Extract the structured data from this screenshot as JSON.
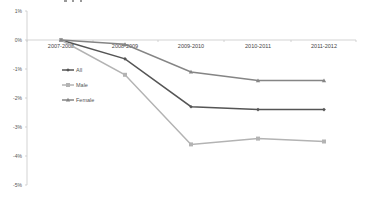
{
  "chart_data": {
    "type": "line",
    "title": "",
    "xlabel": "",
    "ylabel": "",
    "categories": [
      "2007-2008",
      "2008-2009",
      "2009-2010",
      "2010-2011",
      "2011-2012"
    ],
    "y_ticks": [
      "1%",
      "0%",
      "-1%",
      "-2%",
      "-3%",
      "-4%",
      "-5%"
    ],
    "ylim": [
      -5,
      1
    ],
    "grid": false,
    "legend_position": "inside-left",
    "series": [
      {
        "name": "All",
        "color": "#555555",
        "marker": "diamond",
        "values": [
          0,
          -0.65,
          -2.3,
          -2.4,
          -2.4
        ]
      },
      {
        "name": "Male",
        "color": "#b3b3b3",
        "marker": "square",
        "values": [
          0,
          -1.2,
          -3.6,
          -3.4,
          -3.5
        ]
      },
      {
        "name": "Female",
        "color": "#858585",
        "marker": "triangle",
        "values": [
          0,
          -0.15,
          -1.1,
          -1.4,
          -1.4
        ]
      }
    ]
  }
}
